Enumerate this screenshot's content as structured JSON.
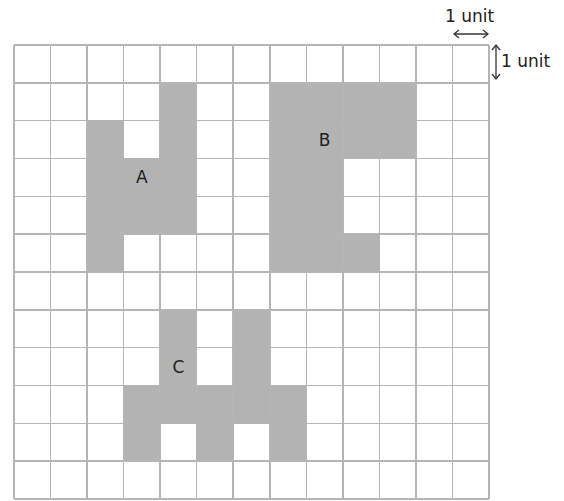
{
  "grid": {
    "columns": 13,
    "rows": 12,
    "line_color": "#b5b5b5",
    "fill_color": "#b3b3b3"
  },
  "scale": {
    "horizontal_label": "1 unit",
    "vertical_label": "1 unit"
  },
  "shapes": [
    {
      "label": "A",
      "label_cell": [
        3,
        3
      ],
      "cells": [
        [
          4,
          1
        ],
        [
          2,
          2
        ],
        [
          4,
          2
        ],
        [
          2,
          3
        ],
        [
          3,
          3
        ],
        [
          4,
          3
        ],
        [
          2,
          4
        ],
        [
          3,
          4
        ],
        [
          4,
          4
        ],
        [
          2,
          5
        ]
      ]
    },
    {
      "label": "B",
      "label_cell": [
        8,
        2
      ],
      "cells": [
        [
          7,
          1
        ],
        [
          8,
          1
        ],
        [
          9,
          1
        ],
        [
          10,
          1
        ],
        [
          7,
          2
        ],
        [
          8,
          2
        ],
        [
          9,
          2
        ],
        [
          10,
          2
        ],
        [
          7,
          3
        ],
        [
          8,
          3
        ],
        [
          7,
          4
        ],
        [
          8,
          4
        ],
        [
          7,
          5
        ],
        [
          8,
          5
        ],
        [
          9,
          5
        ]
      ]
    },
    {
      "label": "C",
      "label_cell": [
        4,
        8
      ],
      "cells": [
        [
          4,
          7
        ],
        [
          6,
          7
        ],
        [
          4,
          8
        ],
        [
          6,
          8
        ],
        [
          3,
          9
        ],
        [
          4,
          9
        ],
        [
          5,
          9
        ],
        [
          6,
          9
        ],
        [
          7,
          9
        ],
        [
          3,
          10
        ],
        [
          5,
          10
        ],
        [
          7,
          10
        ]
      ]
    }
  ]
}
